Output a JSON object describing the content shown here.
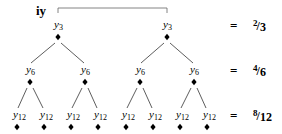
{
  "title": "iy",
  "levels": [
    {
      "node_label": "y",
      "node_subscript": "3",
      "y_label": 28,
      "y_diamond": 37,
      "xs": [
        58,
        167
      ],
      "equation": {
        "equals": "=",
        "numerator": "2",
        "slash": "/",
        "denominator": "3"
      }
    },
    {
      "node_label": "y",
      "node_subscript": "6",
      "y_label": 73,
      "y_diamond": 82,
      "xs": [
        30,
        85,
        140,
        194
      ],
      "equation": {
        "equals": "=",
        "numerator": "4",
        "slash": "/",
        "denominator": "6"
      }
    },
    {
      "node_label": "y",
      "node_subscript": "12",
      "y_label": 118,
      "y_diamond": 127,
      "xs": [
        17,
        44,
        71,
        98,
        126,
        153,
        180,
        207
      ],
      "equation": {
        "equals": "=",
        "numerator": "8",
        "slash": "/",
        "denominator": "12"
      }
    }
  ],
  "bracket": {
    "x1": 58,
    "x2": 167,
    "y_top": 8,
    "y_bottom": 13
  },
  "colors": {
    "ink": "#000000",
    "edge": "#333333",
    "bracket": "#666666"
  }
}
